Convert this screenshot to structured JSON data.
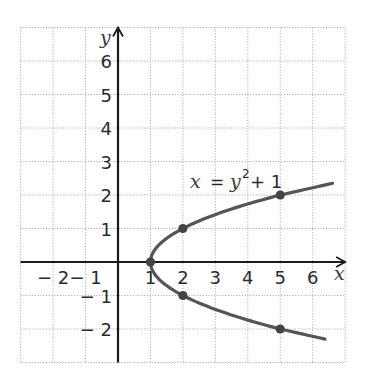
{
  "chart_data": {
    "type": "line",
    "title": "",
    "xlabel": "x",
    "ylabel": "y",
    "xlim": [
      -3,
      7
    ],
    "ylim": [
      -3,
      7
    ],
    "grid": true,
    "grid_style": "dotted",
    "x_ticks": [
      -2,
      -1,
      1,
      2,
      3,
      4,
      5,
      6
    ],
    "y_ticks": [
      -2,
      -1,
      1,
      2,
      3,
      4,
      5,
      6
    ],
    "x_tick_labels": [
      "− 2",
      "− 1",
      "1",
      "2",
      "3",
      "4",
      "5",
      "6"
    ],
    "y_tick_labels": [
      "− 2",
      "− 1",
      "1",
      "2",
      "3",
      "4",
      "5",
      "6"
    ],
    "series": [
      {
        "name": "x = y^2 + 1",
        "equation": "x = y² + 1",
        "color": "#555555",
        "curve": "sideways parabola opening right, vertex (1, 0)",
        "y_range": [
          -2.3,
          2.35
        ]
      }
    ],
    "points": [
      {
        "x": 1,
        "y": 0
      },
      {
        "x": 2,
        "y": 1
      },
      {
        "x": 2,
        "y": -1
      },
      {
        "x": 5,
        "y": 2
      },
      {
        "x": 5,
        "y": -2
      }
    ],
    "annotations": [
      {
        "text": "x = y² + 1",
        "x": 3.3,
        "y": 2.3
      }
    ]
  },
  "labels": {
    "x_axis": "x",
    "y_axis": "y",
    "equation_lhs": "x",
    "equation_eq": "=",
    "equation_y": "y",
    "equation_exp": "2",
    "equation_rest": "+ 1"
  },
  "colors": {
    "curve": "#555555",
    "axis": "#1a1a1a",
    "grid": "#b0b0b0"
  }
}
